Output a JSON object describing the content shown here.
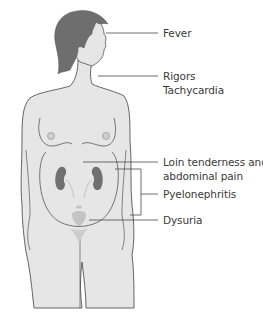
{
  "figure": {
    "colors": {
      "skin": "#e6e6e6",
      "outline": "#555555",
      "hair": "#6e6e6e",
      "kidney": "#707070",
      "bladder": "#c4c4c4",
      "line": "#4a4a4a",
      "text": "#3a3a3a"
    },
    "labels": [
      {
        "id": "fever",
        "text": "Fever"
      },
      {
        "id": "rigors",
        "text": "Rigors"
      },
      {
        "id": "tachycardia",
        "text": "Tachycardia"
      },
      {
        "id": "loin1",
        "text": "Loin tenderness and"
      },
      {
        "id": "loin2",
        "text": "abdominal pain"
      },
      {
        "id": "pyelo",
        "text": "Pyelonephritis"
      },
      {
        "id": "dysuria",
        "text": "Dysuria"
      }
    ]
  }
}
